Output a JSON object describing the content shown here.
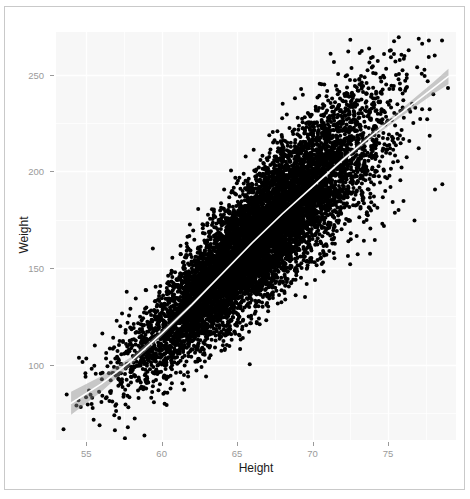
{
  "chart_data": {
    "type": "scatter",
    "title": "",
    "subtitle": "",
    "xlabel": "Height",
    "ylabel": "Weight",
    "xlim": [
      53.0,
      79.5
    ],
    "ylim": [
      61.0,
      272.0
    ],
    "xticks": [
      55,
      60,
      65,
      70,
      75
    ],
    "xtick_labels": [
      "55",
      "60",
      "65",
      "70",
      "75"
    ],
    "yticks": [
      100,
      150,
      200,
      250
    ],
    "ytick_labels": [
      "100",
      "150",
      "200",
      "250"
    ],
    "grid": true,
    "grid_color": "#ffffff",
    "panel_background": "#f7f7f7",
    "legend": "none",
    "point_color": "#000000",
    "point_size": 2.0,
    "n_points": 9000,
    "series": [
      {
        "name": "observations",
        "description": "Height vs Weight scatter cloud, positively correlated",
        "x_mean": 66.4,
        "x_sd": 3.85,
        "y_mean": 161.5,
        "y_sd": 32.2,
        "correlation": 0.8
      }
    ],
    "smooth": {
      "name": "loess smooth",
      "line_color": "#ffffff",
      "band_color": "#8c8c8c",
      "band_opacity": 0.45,
      "line_width": 1.6,
      "x": [
        54.0,
        56.0,
        58.0,
        60.0,
        62.0,
        64.0,
        66.0,
        68.0,
        70.0,
        72.0,
        74.0,
        76.0,
        78.0,
        79.0
      ],
      "y": [
        80.0,
        90.0,
        102.0,
        116.0,
        131.0,
        147.0,
        163.0,
        178.0,
        192.0,
        206.0,
        219.0,
        231.0,
        243.0,
        249.0
      ],
      "ymin": [
        74.0,
        86.0,
        100.0,
        114.5,
        130.0,
        146.3,
        162.4,
        177.4,
        191.4,
        205.0,
        217.5,
        229.0,
        240.0,
        245.0
      ],
      "ymax": [
        86.0,
        94.0,
        104.0,
        117.5,
        132.0,
        147.7,
        163.6,
        178.6,
        192.6,
        207.0,
        220.5,
        233.0,
        246.0,
        253.0
      ]
    }
  },
  "axis": {
    "x_title": "Height",
    "y_title": "Weight"
  }
}
